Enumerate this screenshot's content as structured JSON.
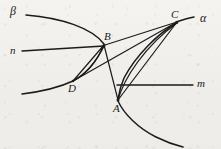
{
  "figure": {
    "type": "geometry-diagram",
    "background_color": "#f2f1ee",
    "ink_color": "#1b1b1b"
  },
  "labels": {
    "plane_beta": "β",
    "plane_alpha": "α",
    "line_n": "n",
    "line_m": "m",
    "point_a": "A",
    "point_b": "B",
    "point_c": "C",
    "point_d": "D"
  },
  "geometry": {
    "points": {
      "A": [
        118,
        100
      ],
      "B": [
        105,
        45
      ],
      "C": [
        178,
        22
      ],
      "D": [
        73,
        82
      ]
    },
    "segments": [
      {
        "name": "D-B",
        "from": "D",
        "to": "B"
      },
      {
        "name": "D-C",
        "from": "D",
        "to": "C"
      },
      {
        "name": "B-A",
        "from": "B",
        "to": "A"
      },
      {
        "name": "B-C",
        "from": "B",
        "to": "C"
      },
      {
        "name": "A-C",
        "from": "A",
        "to": "C"
      }
    ],
    "curves": [
      {
        "name": "beta-trace",
        "label": "β"
      },
      {
        "name": "alpha-trace",
        "label": "α"
      },
      {
        "name": "arc-D-B",
        "label": ""
      },
      {
        "name": "arc-A-C",
        "label": ""
      }
    ],
    "lines": [
      {
        "name": "n",
        "orientation": "horizontal",
        "from": [
          22,
          51
        ],
        "to": [
          105,
          45
        ]
      },
      {
        "name": "m",
        "orientation": "horizontal",
        "from": [
          118,
          85
        ],
        "to": [
          193,
          85
        ]
      }
    ]
  }
}
